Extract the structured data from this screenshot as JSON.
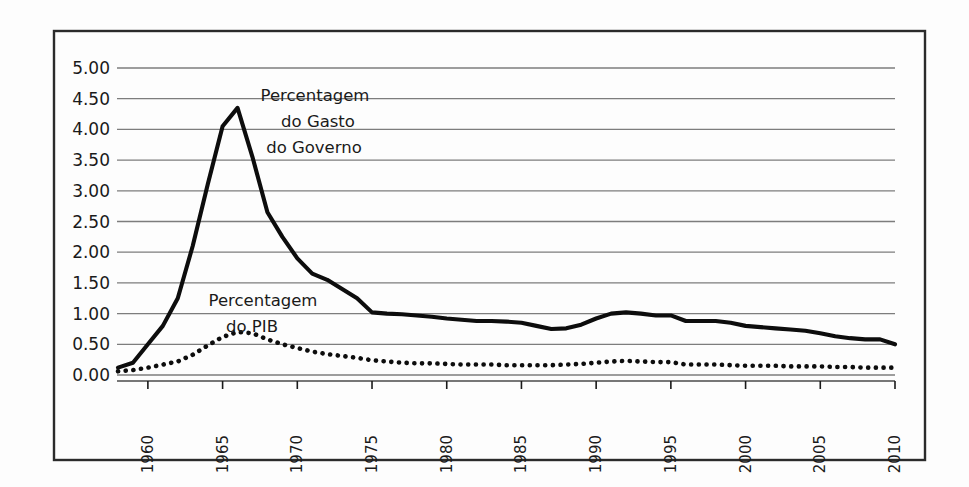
{
  "figure": {
    "background_color": "#fdfdfd",
    "frame_color": "#2b2b2b",
    "gridline_color": "#7d7d7d",
    "series_color": "#0d0d0d"
  },
  "annotations": {
    "gasto": {
      "line1": "Percentagem",
      "line2": "do Gasto",
      "line3": "do Governo"
    },
    "pib": {
      "line1": "Percentagem",
      "line2": "do PIB"
    }
  },
  "chart_data": {
    "type": "line",
    "title": "",
    "subtitle": "",
    "xlabel": "",
    "ylabel": "",
    "xlim": [
      1958,
      2010
    ],
    "ylim": [
      0.0,
      5.0
    ],
    "grid": true,
    "legend_position": "inline-annotations",
    "y_ticks": [
      "5.00",
      "4.50",
      "4.00",
      "3.50",
      "3.00",
      "2.50",
      "2.00",
      "1.50",
      "1.00",
      "0.50",
      "0.00"
    ],
    "y_tick_values": [
      5.0,
      4.5,
      4.0,
      3.5,
      3.0,
      2.5,
      2.0,
      1.5,
      1.0,
      0.5,
      0.0
    ],
    "x_ticks": [
      "1960",
      "1965",
      "1970",
      "1975",
      "1980",
      "1985",
      "1990",
      "1995",
      "2000",
      "2005",
      "2010"
    ],
    "x_tick_values": [
      1960,
      1965,
      1970,
      1975,
      1980,
      1985,
      1990,
      1995,
      2000,
      2005,
      2010
    ],
    "x": [
      1958,
      1959,
      1960,
      1961,
      1962,
      1963,
      1964,
      1965,
      1966,
      1967,
      1968,
      1969,
      1970,
      1971,
      1972,
      1973,
      1974,
      1975,
      1976,
      1977,
      1978,
      1979,
      1980,
      1981,
      1982,
      1983,
      1984,
      1985,
      1986,
      1987,
      1988,
      1989,
      1990,
      1991,
      1992,
      1993,
      1994,
      1995,
      1996,
      1997,
      1998,
      1999,
      2000,
      2001,
      2002,
      2003,
      2004,
      2005,
      2006,
      2007,
      2008,
      2009,
      2010
    ],
    "series": [
      {
        "name": "Percentagem do Gasto do Governo",
        "style": "solid",
        "values": [
          0.12,
          0.2,
          0.5,
          0.8,
          1.25,
          2.1,
          3.1,
          4.05,
          4.35,
          3.55,
          2.65,
          2.25,
          1.9,
          1.65,
          1.55,
          1.4,
          1.25,
          1.02,
          1.0,
          0.99,
          0.97,
          0.95,
          0.92,
          0.9,
          0.88,
          0.88,
          0.87,
          0.85,
          0.8,
          0.75,
          0.76,
          0.82,
          0.92,
          1.0,
          1.02,
          1.0,
          0.97,
          0.97,
          0.88,
          0.88,
          0.88,
          0.85,
          0.8,
          0.78,
          0.76,
          0.74,
          0.72,
          0.68,
          0.63,
          0.6,
          0.58,
          0.58,
          0.5
        ]
      },
      {
        "name": "Percentagem do PIB",
        "style": "dotted",
        "values": [
          0.06,
          0.08,
          0.12,
          0.17,
          0.22,
          0.33,
          0.48,
          0.62,
          0.7,
          0.68,
          0.58,
          0.5,
          0.44,
          0.38,
          0.34,
          0.31,
          0.28,
          0.24,
          0.22,
          0.2,
          0.19,
          0.19,
          0.18,
          0.17,
          0.17,
          0.17,
          0.16,
          0.16,
          0.16,
          0.16,
          0.17,
          0.18,
          0.2,
          0.22,
          0.23,
          0.22,
          0.21,
          0.21,
          0.17,
          0.17,
          0.17,
          0.16,
          0.15,
          0.15,
          0.15,
          0.14,
          0.14,
          0.14,
          0.13,
          0.13,
          0.12,
          0.12,
          0.12
        ]
      }
    ]
  }
}
